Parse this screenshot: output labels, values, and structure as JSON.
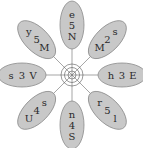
{
  "diagram": {
    "type": "radial-flower",
    "petals": [
      {
        "id": "top",
        "chars": [
          "e",
          "5",
          "N"
        ]
      },
      {
        "id": "top-right",
        "chars": [
          "s",
          "2",
          "M"
        ]
      },
      {
        "id": "right",
        "chars": [
          "E",
          "3",
          "h"
        ]
      },
      {
        "id": "bottom-right",
        "chars": [
          "l",
          "5",
          "r"
        ]
      },
      {
        "id": "bottom",
        "chars": [
          "S",
          "4",
          "n"
        ]
      },
      {
        "id": "bottom-left",
        "chars": [
          "U",
          "4",
          "s"
        ]
      },
      {
        "id": "left",
        "chars": [
          "s",
          "3",
          "V"
        ]
      },
      {
        "id": "top-left",
        "chars": [
          "y",
          "5",
          "M"
        ]
      }
    ],
    "colors": {
      "petal_fill": "#c8c8c8",
      "petal_stroke": "#8a8a8a",
      "lines": "#555555"
    }
  }
}
